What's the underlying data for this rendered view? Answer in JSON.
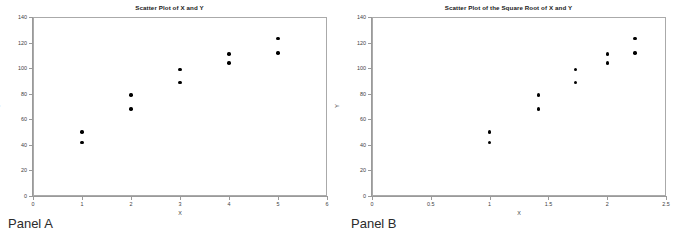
{
  "figure": {
    "panels": [
      {
        "caption": "Panel A",
        "chart_data": {
          "type": "scatter",
          "title": "Scatter Plot of X and Y",
          "xlabel": "X",
          "ylabel": "Y",
          "xlim": [
            0,
            6
          ],
          "ylim": [
            0,
            140
          ],
          "xticks": [
            "0",
            "1",
            "2",
            "3",
            "4",
            "5",
            "6"
          ],
          "xtick_values": [
            0,
            1,
            2,
            3,
            4,
            5,
            6
          ],
          "yticks": [
            "0",
            "20",
            "40",
            "60",
            "80",
            "100",
            "120",
            "140"
          ],
          "ytick_values": [
            0,
            20,
            40,
            60,
            80,
            100,
            120,
            140
          ],
          "grid": false,
          "legend": null,
          "marker_color": "#000000",
          "series": [
            {
              "name": "X vs Y",
              "x": [
                1,
                1,
                2,
                2,
                3,
                3,
                4,
                4,
                5,
                5
              ],
              "y": [
                42,
                50,
                68,
                79,
                89,
                99,
                104,
                111,
                112,
                123
              ]
            }
          ]
        }
      },
      {
        "caption": "Panel B",
        "chart_data": {
          "type": "scatter",
          "title": "Scatter Plot of the Square Root of X and Y",
          "xlabel": "X",
          "ylabel": "Y",
          "xlim": [
            0,
            2.5
          ],
          "ylim": [
            0,
            140
          ],
          "xticks": [
            "0",
            "0.5",
            "1",
            "1.5",
            "2",
            "2.5"
          ],
          "xtick_values": [
            0,
            0.5,
            1,
            1.5,
            2,
            2.5
          ],
          "yticks": [
            "0",
            "20",
            "40",
            "60",
            "80",
            "100",
            "120",
            "140"
          ],
          "ytick_values": [
            0,
            20,
            40,
            60,
            80,
            100,
            120,
            140
          ],
          "grid": false,
          "legend": null,
          "marker_color": "#000000",
          "series": [
            {
              "name": "sqrt(X) vs Y",
              "x": [
                1,
                1,
                1.414,
                1.414,
                1.732,
                1.732,
                2,
                2,
                2.236,
                2.236
              ],
              "y": [
                42,
                50,
                68,
                79,
                89,
                99,
                104,
                111,
                112,
                123
              ]
            }
          ]
        }
      }
    ]
  }
}
